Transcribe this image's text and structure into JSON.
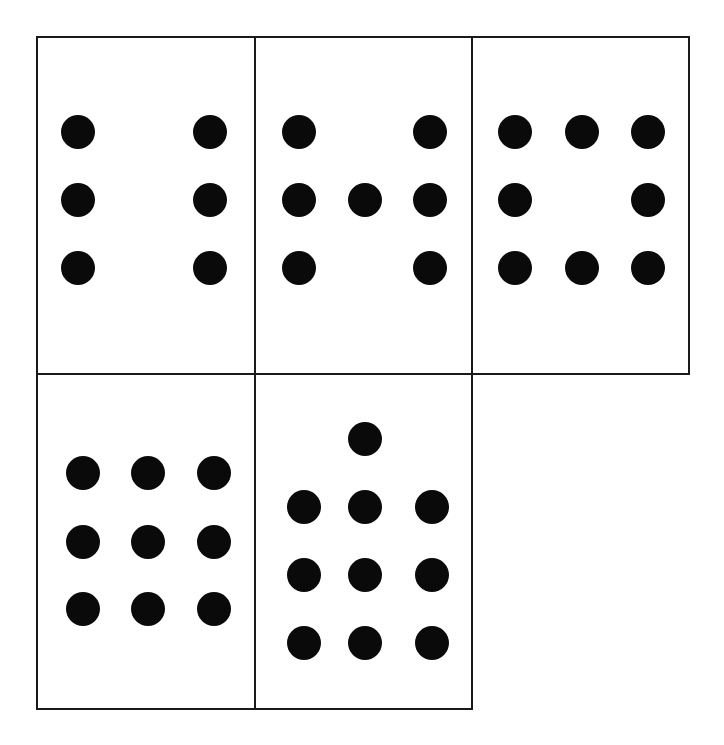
{
  "page": {
    "background_color": "#ffffff",
    "border_color": "#1a1a1a",
    "pip_color": "#0a0a0a",
    "width": 724,
    "height": 745
  },
  "chart_data": {
    "type": "scatter",
    "subtitle": "Five bordered rectangular cards laid out in a 3-over-2 grid; each card shows a count of filled black circular pips.",
    "xlabel": "",
    "ylabel": "",
    "grid": false,
    "legend": "none",
    "xlim": [
      0,
      724
    ],
    "ylim": [
      0,
      745
    ],
    "pip_diameter": 34,
    "pip_color": "#0a0a0a",
    "border_color": "#1a1a1a",
    "border_width": 2,
    "categories": [
      "Card 1",
      "Card 2",
      "Card 3",
      "Card 4",
      "Card 5"
    ],
    "values": [
      6,
      7,
      8,
      9,
      10
    ],
    "layout": {
      "rows": 2,
      "top_row_cards": 3,
      "bottom_row_cards": 2,
      "outer_left": 36,
      "outer_top": 36,
      "outer_right": 688,
      "outer_bottom": 708,
      "vertical_dividers_x": [
        254,
        471
      ],
      "horizontal_divider_y": 373
    },
    "cards": [
      {
        "id": "card-1",
        "label": "Card 1",
        "pip_count": 6,
        "pattern": "2 columns x 3 rows",
        "row": 1,
        "col": 1,
        "rect": {
          "left": 36,
          "top": 36,
          "width": 220,
          "height": 339
        },
        "pips": [
          {
            "cx": 76,
            "cy": 130
          },
          {
            "cx": 208,
            "cy": 130
          },
          {
            "cx": 76,
            "cy": 198
          },
          {
            "cx": 208,
            "cy": 198
          },
          {
            "cx": 76,
            "cy": 266
          },
          {
            "cx": 208,
            "cy": 266
          }
        ]
      },
      {
        "id": "card-2",
        "label": "Card 2",
        "pip_count": 7,
        "pattern": "2 columns x 3 rows plus one center pip on middle row",
        "row": 1,
        "col": 2,
        "rect": {
          "left": 254,
          "top": 36,
          "width": 219,
          "height": 339
        },
        "pips": [
          {
            "cx": 297,
            "cy": 130
          },
          {
            "cx": 428,
            "cy": 130
          },
          {
            "cx": 297,
            "cy": 198
          },
          {
            "cx": 363,
            "cy": 198
          },
          {
            "cx": 428,
            "cy": 198
          },
          {
            "cx": 297,
            "cy": 266
          },
          {
            "cx": 428,
            "cy": 266
          }
        ]
      },
      {
        "id": "card-3",
        "label": "Card 3",
        "pip_count": 8,
        "pattern": "3 x 3 grid with the center pip omitted",
        "row": 1,
        "col": 3,
        "rect": {
          "left": 471,
          "top": 36,
          "width": 219,
          "height": 339
        },
        "pips": [
          {
            "cx": 513,
            "cy": 130
          },
          {
            "cx": 580,
            "cy": 130
          },
          {
            "cx": 646,
            "cy": 130
          },
          {
            "cx": 513,
            "cy": 198
          },
          {
            "cx": 646,
            "cy": 198
          },
          {
            "cx": 513,
            "cy": 266
          },
          {
            "cx": 580,
            "cy": 266
          },
          {
            "cx": 646,
            "cy": 266
          }
        ]
      },
      {
        "id": "card-4",
        "label": "Card 4",
        "pip_count": 9,
        "pattern": "full 3 x 3 grid",
        "row": 2,
        "col": 1,
        "rect": {
          "left": 36,
          "top": 373,
          "width": 220,
          "height": 337
        },
        "pips": [
          {
            "cx": 81,
            "cy": 471
          },
          {
            "cx": 146,
            "cy": 471
          },
          {
            "cx": 212,
            "cy": 471
          },
          {
            "cx": 81,
            "cy": 540
          },
          {
            "cx": 146,
            "cy": 540
          },
          {
            "cx": 212,
            "cy": 540
          },
          {
            "cx": 81,
            "cy": 607
          },
          {
            "cx": 146,
            "cy": 607
          },
          {
            "cx": 212,
            "cy": 607
          }
        ]
      },
      {
        "id": "card-5",
        "label": "Card 5",
        "pip_count": 10,
        "pattern": "3 x 3 grid plus one extra pip above the top-center position",
        "row": 2,
        "col": 2,
        "rect": {
          "left": 254,
          "top": 373,
          "width": 219,
          "height": 337
        },
        "pips": [
          {
            "cx": 363,
            "cy": 437
          },
          {
            "cx": 302,
            "cy": 505
          },
          {
            "cx": 363,
            "cy": 505
          },
          {
            "cx": 430,
            "cy": 505
          },
          {
            "cx": 302,
            "cy": 573
          },
          {
            "cx": 363,
            "cy": 573
          },
          {
            "cx": 430,
            "cy": 573
          },
          {
            "cx": 302,
            "cy": 641
          },
          {
            "cx": 363,
            "cy": 641
          },
          {
            "cx": 430,
            "cy": 641
          }
        ]
      }
    ]
  }
}
